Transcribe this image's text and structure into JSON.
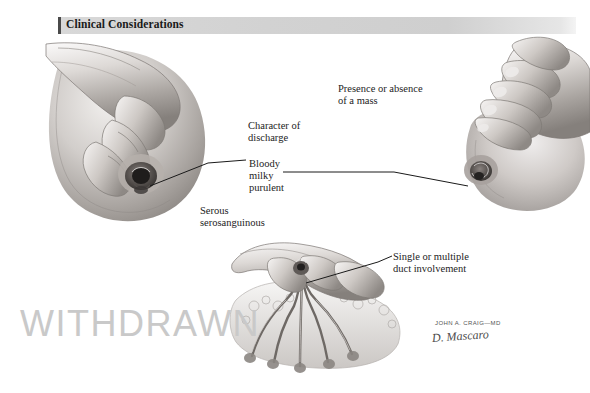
{
  "page": {
    "background_color": "#ffffff",
    "width": 590,
    "height": 393
  },
  "header": {
    "title": "Clinical Considerations",
    "banner_color": "#d4d4d4",
    "accent_bar_color": "#4a4a4a",
    "text_color": "#1a1a1a"
  },
  "annotations": [
    {
      "id": "presence-of-mass",
      "text": "Presence or absence\nof a mass"
    },
    {
      "id": "character",
      "text": "Character of\ndischarge"
    },
    {
      "id": "discharge-types",
      "text": "Bloody\nmilky\npurulent"
    },
    {
      "id": "serous-types",
      "text": "Serous\nserosanguinous"
    },
    {
      "id": "duct-involvement",
      "text": "Single or multiple\nduct involvement"
    }
  ],
  "watermark": {
    "text": "WITHDRAWN",
    "color": "#c9c9c9"
  },
  "signature": {
    "name": "JOHN A. CRAIG—MD",
    "script": "D. Mascaro",
    "color": "#4b4b4b"
  },
  "figures": [
    {
      "id": "figure-left",
      "caption_role": "hand compressing breast, nipple discharge expressed",
      "position": {
        "x": 35,
        "y": 42,
        "width": 195,
        "height": 185
      }
    },
    {
      "id": "figure-right",
      "caption_role": "hand palpating breast from above for a mass",
      "position": {
        "x": 462,
        "y": 40,
        "width": 120,
        "height": 178
      }
    },
    {
      "id": "figure-bottom",
      "caption_role": "cross-section showing ducts converging at nipple",
      "position": {
        "x": 228,
        "y": 243,
        "width": 178,
        "height": 128
      }
    }
  ],
  "leader_lines": [
    {
      "id": "leader-bloody-to-left-nipple",
      "from": "discharge-types",
      "to": "figure-left"
    },
    {
      "id": "leader-milky-to-right-nipple",
      "from": "discharge-types",
      "to": "figure-right"
    },
    {
      "id": "leader-duct-to-bottom-nipple",
      "from": "duct-involvement",
      "to": "figure-bottom"
    }
  ],
  "artwork": {
    "medium": "grayscale pencil and wash medical illustration",
    "ink_color": "#2b2b2b",
    "mid_tone": "#9a9a9a",
    "light_tone": "#d6d6d6"
  }
}
